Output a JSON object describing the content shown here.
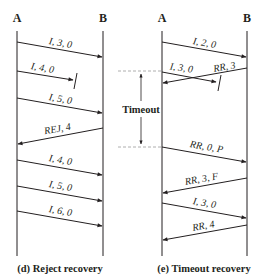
{
  "colors": {
    "line": "#231f20",
    "dashed": "#9a9a9a",
    "background": "#ffffff"
  },
  "left_diagram": {
    "station_a": "A",
    "station_b": "B",
    "caption": "(d) Reject recovery",
    "messages": [
      {
        "label": "I, 3, 0",
        "direction": "A->B",
        "lost": false
      },
      {
        "label": "I, 4, 0",
        "direction": "A->B",
        "lost": true
      },
      {
        "label": "I, 5, 0",
        "direction": "A->B",
        "lost": false
      },
      {
        "label": "REJ, 4",
        "direction": "B->A",
        "lost": false
      },
      {
        "label": "I, 4, 0",
        "direction": "A->B",
        "lost": false
      },
      {
        "label": "I, 5, 0",
        "direction": "A->B",
        "lost": false
      },
      {
        "label": "I, 6, 0",
        "direction": "A->B",
        "lost": false
      }
    ]
  },
  "right_diagram": {
    "station_a": "A",
    "station_b": "B",
    "caption": "(e) Timeout recovery",
    "timeout_label": "Timeout",
    "messages": [
      {
        "label": "I, 2, 0",
        "direction": "A->B",
        "lost": false
      },
      {
        "label": "I, 3, 0",
        "direction": "A->B",
        "lost": true
      },
      {
        "label": "RR, 3",
        "direction": "B->A",
        "lost": false
      },
      {
        "label": "RR, 0, P",
        "direction": "A->B",
        "lost": false
      },
      {
        "label": "RR, 3, F",
        "direction": "B->A",
        "lost": false
      },
      {
        "label": "I, 3, 0",
        "direction": "A->B",
        "lost": false
      },
      {
        "label": "RR, 4",
        "direction": "B->A",
        "lost": false
      }
    ]
  }
}
